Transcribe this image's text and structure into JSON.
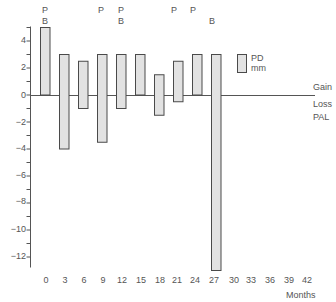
{
  "chart_data": {
    "type": "bar",
    "subtype": "floating-range",
    "title": "",
    "xlabel": "Months",
    "ylabel": "",
    "ylim": [
      -13,
      5
    ],
    "y_ticks": [
      4,
      2,
      0,
      -2,
      -4,
      -6,
      -8,
      -10,
      -12
    ],
    "y_tick_labels": [
      "4",
      "2",
      "0",
      "−12",
      "−4"
    ],
    "x_ticks": [
      0,
      3,
      6,
      9,
      12,
      15,
      18,
      21,
      24,
      27,
      30,
      33,
      36,
      39,
      42
    ],
    "categories": [
      "0",
      "3",
      "6",
      "9",
      "12",
      "15",
      "18",
      "21",
      "24",
      "27"
    ],
    "series": [
      {
        "name": "PD mm",
        "gain": [
          5,
          3,
          2.5,
          3,
          3,
          3,
          1.5,
          2.5,
          3,
          3
        ],
        "loss": [
          0,
          -4,
          -1,
          -3.5,
          -1,
          0,
          -1.5,
          -0.5,
          0,
          -13
        ]
      }
    ],
    "annotations": [
      {
        "month": 0,
        "labels": [
          "P",
          "B"
        ]
      },
      {
        "month": 9,
        "labels": [
          "P"
        ]
      },
      {
        "month": 12,
        "labels": [
          "P",
          "B"
        ]
      },
      {
        "month": 21,
        "labels": [
          "P"
        ]
      },
      {
        "month": 24,
        "labels": [
          "P"
        ]
      },
      {
        "month": 27,
        "labels": [
          "",
          "B"
        ]
      }
    ],
    "zero_line_labels": {
      "above": "Gain",
      "below": [
        "Loss",
        "PAL"
      ]
    },
    "legend": {
      "entries": [
        "PD",
        "mm"
      ],
      "position": "upper-right"
    },
    "grid": false
  },
  "labels": {
    "y": [
      "4",
      "2",
      "0",
      "−2",
      "−4",
      "−6",
      "−8",
      "−10",
      "−12"
    ],
    "x": [
      "0",
      "3",
      "6",
      "9",
      "12",
      "15",
      "18",
      "21",
      "24",
      "27",
      "30",
      "33",
      "36",
      "39",
      "42"
    ],
    "xlabel": "Months",
    "gain": "Gain",
    "loss": "Loss",
    "pal": "PAL",
    "legend_line1": "PD",
    "legend_line2": "mm",
    "p": "P",
    "b": "B"
  },
  "colors": {
    "bar_fill": "#e2e2e2",
    "bar_stroke": "#4a4a4a",
    "axis": "#555555",
    "text": "#555555"
  }
}
